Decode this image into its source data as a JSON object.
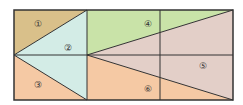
{
  "diagram": {
    "regions": [
      {
        "id": "1",
        "label": "①",
        "color": "#d9c08a"
      },
      {
        "id": "2",
        "label": "②",
        "color": "#d3ece6"
      },
      {
        "id": "3",
        "label": "③",
        "color": "#f5c9a4"
      },
      {
        "id": "4",
        "label": "④",
        "color": "#c9e3a8"
      },
      {
        "id": "5",
        "label": "⑤",
        "color": "#e3cfc8"
      },
      {
        "id": "6",
        "label": "⑥",
        "color": "#f5c9a4"
      }
    ]
  }
}
